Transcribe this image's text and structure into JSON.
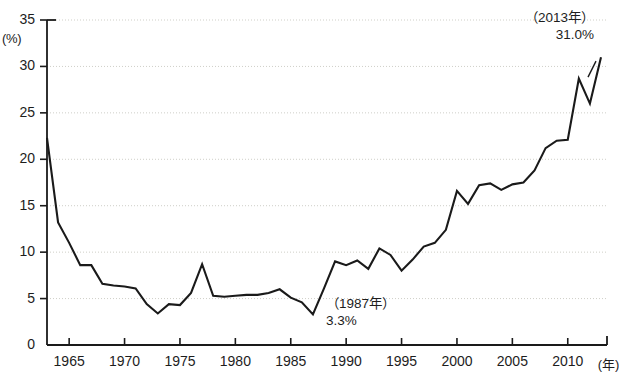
{
  "chart_data": {
    "type": "line",
    "title": "",
    "subtitle": "",
    "xlabel": "(年)",
    "ylabel": "(%)",
    "xlim": [
      1963,
      2013
    ],
    "ylim": [
      0,
      35
    ],
    "grid": true,
    "legend": "none",
    "y_ticks": [
      0,
      5,
      10,
      15,
      20,
      25,
      30,
      35
    ],
    "y_tick_labels": [
      "0",
      "5",
      "10",
      "15",
      "20",
      "25",
      "30",
      "35"
    ],
    "x_ticks": [
      1965,
      1970,
      1975,
      1980,
      1985,
      1990,
      1995,
      2000,
      2005,
      2010
    ],
    "x_tick_labels": [
      "1965",
      "1970",
      "1975",
      "1980",
      "1985",
      "1990",
      "1995",
      "2000",
      "2005",
      "2010"
    ],
    "series": [
      {
        "name": "rate",
        "color": "#1a1a1a",
        "x": [
          1963,
          1964,
          1965,
          1966,
          1967,
          1968,
          1969,
          1970,
          1971,
          1972,
          1973,
          1974,
          1975,
          1976,
          1977,
          1978,
          1979,
          1980,
          1981,
          1982,
          1983,
          1984,
          1985,
          1986,
          1987,
          1988,
          1989,
          1990,
          1991,
          1992,
          1993,
          1994,
          1995,
          1996,
          1997,
          1998,
          1999,
          2000,
          2001,
          2002,
          2003,
          2004,
          2005,
          2006,
          2007,
          2008,
          2009,
          2010,
          2011,
          2012,
          2013
        ],
        "values": [
          22.3,
          13.2,
          11.0,
          8.6,
          8.6,
          6.6,
          6.4,
          6.3,
          6.1,
          4.4,
          3.4,
          4.4,
          4.3,
          5.6,
          8.7,
          5.3,
          5.2,
          5.3,
          5.4,
          5.4,
          5.6,
          6.0,
          5.1,
          4.6,
          3.3,
          6.1,
          9.0,
          8.6,
          9.1,
          8.2,
          10.4,
          9.7,
          8.0,
          9.2,
          10.6,
          11.0,
          12.4,
          16.6,
          15.2,
          17.2,
          17.4,
          16.7,
          17.3,
          17.5,
          18.8,
          21.2,
          22.0,
          22.1,
          28.7,
          26.0,
          31.0
        ]
      }
    ],
    "annotations": [
      {
        "name": "peak-2013",
        "line1": "（2013年）",
        "line2": "31.0%",
        "x": 2013,
        "y": 31.0
      },
      {
        "name": "trough-1987",
        "line1": "（1987年）",
        "line2": "3.3%",
        "x": 1987,
        "y": 3.3
      }
    ]
  },
  "axis": {
    "y_unit": "(%)",
    "x_unit": "(年)"
  }
}
